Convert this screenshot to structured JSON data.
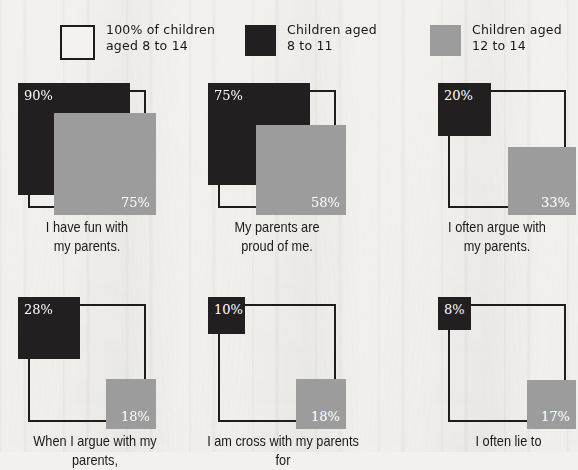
{
  "legend": {
    "items": [
      {
        "id": "reference",
        "swatch": "outline-square-swatch",
        "label": "100% of children\naged 8 to 14",
        "color": "#ffffff"
      },
      {
        "id": "age-8-11",
        "swatch": "dark-square-swatch",
        "label": "Children aged\n8 to 11",
        "color": "#231f20"
      },
      {
        "id": "age-12-14",
        "swatch": "gray-square-swatch",
        "label": "Children aged\n12 to 14",
        "color": "#9c9c9c"
      }
    ]
  },
  "chart_data": {
    "type": "bar",
    "title": "",
    "xlabel": "",
    "ylabel": "",
    "ylim": [
      0,
      100
    ],
    "grid": false,
    "legend_position": "top",
    "note": "Nested-square area chart: outline square = 100% reference; dark square = children aged 8 to 11; gray square = children aged 12 to 14. Values are percentages.",
    "categories": [
      "I have fun with my parents.",
      "My parents are proud of me.",
      "I often argue with my parents.",
      "When I argue with my parents,",
      "I am cross with my parents for",
      "I often lie to"
    ],
    "series": [
      {
        "name": "100% of children aged 8 to 14",
        "values": [
          100,
          100,
          100,
          100,
          100,
          100
        ]
      },
      {
        "name": "Children aged 8 to 11",
        "values": [
          90,
          75,
          20,
          28,
          10,
          8
        ]
      },
      {
        "name": "Children aged 12 to 14",
        "values": [
          75,
          58,
          33,
          18,
          18,
          17
        ]
      }
    ]
  },
  "charts": [
    {
      "id": "fun-with-parents",
      "caption": "I have fun with\nmy parents.",
      "dark": {
        "value": 90,
        "label": "90%"
      },
      "gray": {
        "value": 75,
        "label": "75%"
      }
    },
    {
      "id": "parents-proud",
      "caption": "My parents are\nproud of me.",
      "dark": {
        "value": 75,
        "label": "75%"
      },
      "gray": {
        "value": 58,
        "label": "58%"
      }
    },
    {
      "id": "often-argue",
      "caption": "I often argue with\nmy parents.",
      "dark": {
        "value": 20,
        "label": "20%"
      },
      "gray": {
        "value": 33,
        "label": "33%"
      }
    },
    {
      "id": "when-i-argue",
      "caption": "When I argue with my parents,",
      "dark": {
        "value": 28,
        "label": "28%"
      },
      "gray": {
        "value": 18,
        "label": "18%"
      }
    },
    {
      "id": "cross-with-parents",
      "caption": "I am cross with my parents for",
      "dark": {
        "value": 10,
        "label": "10%"
      },
      "gray": {
        "value": 18,
        "label": "18%"
      }
    },
    {
      "id": "often-lie",
      "caption": "I often lie to",
      "dark": {
        "value": 8,
        "label": "8%"
      },
      "gray": {
        "value": 17,
        "label": "17%"
      }
    }
  ]
}
